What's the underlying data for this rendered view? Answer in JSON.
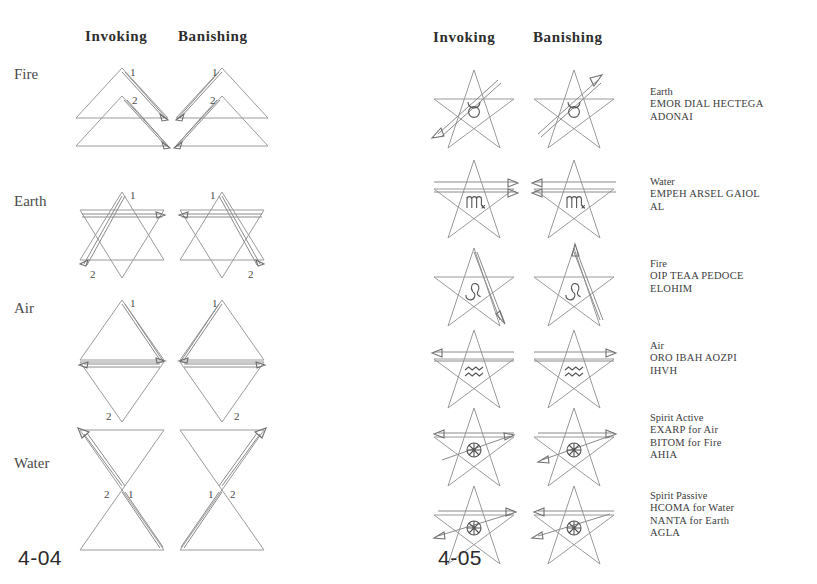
{
  "figures": [
    {
      "id": "4-04",
      "number": "4-04",
      "kind": "hexagram-rituals",
      "columns": [
        "Invoking",
        "Banishing"
      ],
      "rows": [
        {
          "label": "Fire",
          "shape": "two-upward-triangles",
          "stroke_order": [
            "1",
            "2"
          ]
        },
        {
          "label": "Earth",
          "shape": "hexagram-star",
          "stroke_order": [
            "1",
            "2"
          ]
        },
        {
          "label": "Air",
          "shape": "vertical-rhombus",
          "stroke_order": [
            "1",
            "2"
          ]
        },
        {
          "label": "Water",
          "shape": "hourglass",
          "stroke_order": [
            "1",
            "2"
          ]
        }
      ]
    },
    {
      "id": "4-05",
      "number": "4-05",
      "kind": "pentagram-rituals",
      "columns": [
        "Invoking",
        "Banishing"
      ],
      "rows": [
        {
          "element": "Earth",
          "sigil": "taurus-symbol",
          "names": [
            "EMOR DIAL HECTEGA",
            "ADONAI"
          ]
        },
        {
          "element": "Water",
          "sigil": "scorpio-symbol",
          "names": [
            "EMPEH ARSEL GAIOL",
            "AL"
          ]
        },
        {
          "element": "Fire",
          "sigil": "leo-symbol",
          "names": [
            "OIP TEAA PEDOCE",
            "ELOHIM"
          ]
        },
        {
          "element": "Air",
          "sigil": "aquarius-symbol",
          "names": [
            "ORO IBAH AOZPI",
            "IHVH"
          ]
        },
        {
          "element": "Spirit Active",
          "sigil": "spirit-wheel-symbol",
          "names": [
            "EXARP for Air",
            "BITOM for Fire",
            "AHIA"
          ]
        },
        {
          "element": "Spirit Passive",
          "sigil": "spirit-wheel-symbol",
          "names": [
            "HCOMA for Water",
            "NANTA for Earth",
            "AGLA"
          ]
        }
      ]
    }
  ],
  "colors": {
    "background": "#ffffff",
    "ink": "#3a3a3a",
    "line": "#9a9a9a",
    "line_dark": "#6f6f6f"
  }
}
